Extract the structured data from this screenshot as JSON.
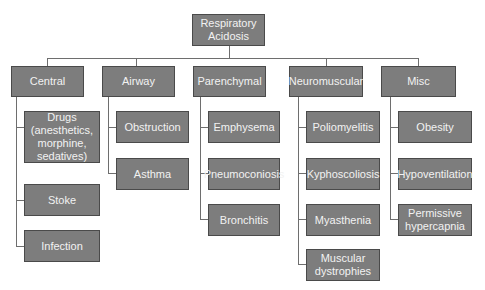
{
  "diagram": {
    "root": {
      "label": "Respiratory\nAcidosis"
    },
    "categories": [
      {
        "label": "Central",
        "children": [
          "Drugs\n(anesthetics,\nmorphine,\nsedatives)",
          "Stoke",
          "Infection"
        ]
      },
      {
        "label": "Airway",
        "children": [
          "Obstruction",
          "Asthma"
        ]
      },
      {
        "label": "Parenchymal",
        "children": [
          "Emphysema",
          "Pneumoconiosis",
          "Bronchitis"
        ]
      },
      {
        "label": "Neuromuscular",
        "children": [
          "Poliomyelitis",
          "Kyphoscoliosis",
          "Myasthenia",
          "Muscular\ndystrophies"
        ]
      },
      {
        "label": "Misc",
        "children": [
          "Obesity",
          "Hypoventilation",
          "Permissive\nhypercapnia"
        ]
      }
    ]
  }
}
